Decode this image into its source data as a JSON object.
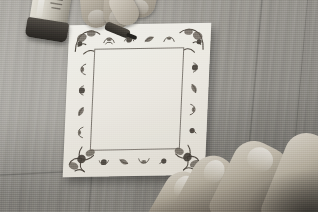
{
  "image": {
    "type": "photograph",
    "title": "Hand decorating a square paper sheet with an ornate border on a wooden table",
    "orientation": "landscape",
    "width_px": 325,
    "height_px": 224,
    "color_mode": "desaturated / near-monochrome",
    "photo_area": {
      "width_px": 318,
      "height_px": 212
    },
    "margin": {
      "right_px": 7,
      "bottom_px": 12,
      "color": "#ffffff"
    }
  },
  "scene": {
    "setting": "wooden table top viewed from above at an angle",
    "background_label": "wood table surface",
    "background_color": "#9b9892",
    "grain_direction": "vertical planks running top to bottom",
    "lighting": "soft light from upper left, shadow falling lower right"
  },
  "objects": {
    "paper": {
      "name": "square paper sheet",
      "color": "#f6f4ee",
      "shape": "square, tilted slightly counter-clockwise",
      "position": "center-left of frame"
    },
    "border_design": {
      "name": "ornate floral scroll border",
      "ink_color": "#4e473f",
      "description": "hand-drawn repeating leaf, rose and ribbon motifs framing an empty centre panel",
      "corner_motif": "bow / fleur ornament",
      "center": "blank"
    },
    "bottle": {
      "name": "glue or paint bottle",
      "body_color": "#dcd8cd",
      "cap_color": "#2e2a26",
      "position": "upper left corner, partly cropped"
    },
    "hand_top": {
      "name": "drawing hand",
      "skin_color": "#bfb7a9",
      "holding": "applicator pen",
      "position": "top centre, fingers pointing down onto the paper"
    },
    "applicator": {
      "name": "applicator pen tip",
      "color": "#211e1a"
    },
    "hand_bottom": {
      "name": "steadying hand",
      "skin_color": "#b7af9f",
      "position": "bottom right, four fingers entering the frame"
    }
  },
  "labels": {
    "none_visible": "This photograph contains no on-screen text, UI controls or readable labels."
  }
}
